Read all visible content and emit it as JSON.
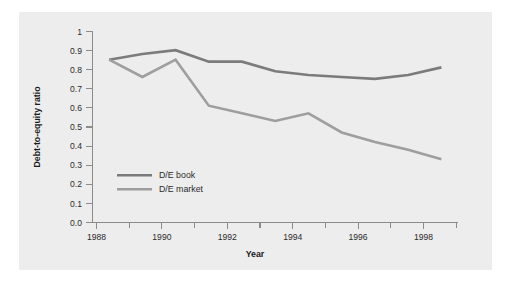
{
  "chart_data": {
    "type": "line",
    "title": "",
    "xlabel": "Year",
    "ylabel": "Debt-to-equity ratio",
    "xlim": [
      1988.0,
      1999.0
    ],
    "ylim": [
      0.0,
      1.0
    ],
    "grid": false,
    "legend_position": "inside-left-lower",
    "x": [
      1988.5,
      1989.5,
      1990.5,
      1991.5,
      1992.5,
      1993.5,
      1994.5,
      1995.5,
      1996.5,
      1997.5,
      1998.5
    ],
    "x_tick_labels": [
      "1988",
      "1990",
      "1992",
      "1994",
      "1996",
      "1998"
    ],
    "x_tick_values": [
      1988,
      1990,
      1992,
      1994,
      1996,
      1998
    ],
    "x_minor_tick_values": [
      1989,
      1991,
      1993,
      1995,
      1997,
      1999
    ],
    "y_tick_labels": [
      "1",
      "0.9",
      "0.8",
      "0.7",
      "0.6",
      "0.5",
      "0.4",
      "0.3",
      "0.2",
      "0.1",
      "0.0"
    ],
    "y_tick_values": [
      1.0,
      0.9,
      0.8,
      0.7,
      0.6,
      0.5,
      0.4,
      0.3,
      0.2,
      0.1,
      0.0
    ],
    "series": [
      {
        "name": "D/E book",
        "color": "#7b7b7b",
        "values": [
          0.85,
          0.88,
          0.9,
          0.84,
          0.84,
          0.79,
          0.77,
          0.76,
          0.75,
          0.77,
          0.81
        ]
      },
      {
        "name": "D/E market",
        "color": "#9e9e9e",
        "values": [
          0.85,
          0.76,
          0.85,
          0.61,
          0.57,
          0.53,
          0.57,
          0.47,
          0.42,
          0.38,
          0.33
        ]
      }
    ]
  },
  "legend": {
    "entries": [
      {
        "label": "D/E book",
        "color": "#7b7b7b"
      },
      {
        "label": "D/E market",
        "color": "#9e9e9e"
      }
    ]
  },
  "axes": {
    "y_title": "Debt-to-equity ratio",
    "x_title": "Year"
  },
  "colors": {
    "panel_background": "#ededed",
    "figure_background": "#ffffff",
    "axis": "#8c8c8c",
    "text": "#2b2b2b",
    "series_book": "#7b7b7b",
    "series_market": "#9e9e9e"
  }
}
